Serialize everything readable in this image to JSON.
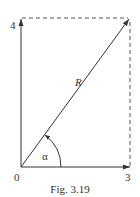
{
  "figure": {
    "caption": "Fig. 3.19",
    "labels": {
      "y_tick": "4",
      "x_tick": "3",
      "origin": "0",
      "resultant": "R",
      "angle": "α"
    },
    "vectors": [
      {
        "name": "vertical",
        "from": [
          0,
          0
        ],
        "to": [
          0,
          4
        ]
      },
      {
        "name": "horizontal",
        "from": [
          0,
          0
        ],
        "to": [
          3,
          0
        ]
      },
      {
        "name": "resultant",
        "from": [
          0,
          0
        ],
        "to": [
          3,
          4
        ],
        "label": "R"
      }
    ],
    "dashed_lines": [
      {
        "from": [
          0,
          4
        ],
        "to": [
          3,
          4
        ]
      },
      {
        "from": [
          3,
          0
        ],
        "to": [
          3,
          4
        ]
      }
    ],
    "colors": {
      "line": "#333333",
      "dash": "#555555"
    }
  }
}
